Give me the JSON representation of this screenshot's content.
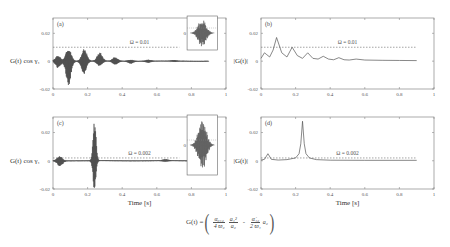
{
  "figure": {
    "formula": {
      "lhs": "G(t) =",
      "term1_num": "α₀₁₂",
      "term1_den": "4 ϖ₂",
      "term2_num": "a₁²",
      "term2_den": "a₂",
      "minus": "-",
      "term3_num": "α̇₁₂",
      "term3_den": "2 ϖ₁",
      "term3_tail": "a₂"
    }
  },
  "chart_data": [
    {
      "panel": "(a)",
      "type": "line",
      "title": "",
      "xlabel": "",
      "ylabel": "G(t) cos γ₁",
      "xlim": [
        0,
        1
      ],
      "ylim": [
        -0.02,
        0.031
      ],
      "xticks": [
        "0",
        "0.2",
        "0.4",
        "0.6",
        "0.8",
        "1"
      ],
      "yticks": [
        "-0.02",
        "0",
        "0.02"
      ],
      "annotation": "Ω = 0.01",
      "threshold": 0.01,
      "description": "Decaying oscillatory wave packets with peaks near t≈0.09, 0.18, 0.27, 0.36; inset shows zoomed packet",
      "envelope_peaks": [
        {
          "t": 0.03,
          "amp": 0.005
        },
        {
          "t": 0.09,
          "amp": 0.017
        },
        {
          "t": 0.18,
          "amp": 0.01
        },
        {
          "t": 0.27,
          "amp": 0.006
        },
        {
          "t": 0.36,
          "amp": 0.003
        },
        {
          "t": 0.45,
          "amp": 0.0015
        },
        {
          "t": 0.55,
          "amp": 0.001
        },
        {
          "t": 0.7,
          "amp": 0.0005
        }
      ],
      "inset": {
        "label": "0"
      }
    },
    {
      "panel": "(b)",
      "type": "line",
      "xlabel": "",
      "ylabel": "|G(t)|",
      "xlim": [
        0,
        1
      ],
      "ylim": [
        -0.02,
        0.031
      ],
      "xticks": [
        "0",
        "0.2",
        "0.4",
        "0.6",
        "0.8",
        "1"
      ],
      "yticks": [
        "-0.02",
        "0",
        "0.02"
      ],
      "annotation": "Ω = 0.01",
      "threshold": 0.01,
      "x": [
        0,
        0.02,
        0.03,
        0.05,
        0.07,
        0.09,
        0.12,
        0.15,
        0.18,
        0.21,
        0.24,
        0.27,
        0.3,
        0.33,
        0.36,
        0.39,
        0.42,
        0.45,
        0.48,
        0.51,
        0.55,
        0.6,
        0.7,
        0.8,
        0.9
      ],
      "values": [
        0.002,
        0.006,
        0.005,
        0.003,
        0.008,
        0.017,
        0.006,
        0.003,
        0.01,
        0.004,
        0.002,
        0.006,
        0.002,
        0.0015,
        0.0035,
        0.0015,
        0.001,
        0.0025,
        0.001,
        0.0008,
        0.0015,
        0.0008,
        0.0006,
        0.0005,
        0.0004
      ]
    },
    {
      "panel": "(c)",
      "type": "line",
      "xlabel": "Time [s]",
      "ylabel": "G(t) cos γ₁",
      "xlim": [
        0,
        1
      ],
      "ylim": [
        -0.02,
        0.031
      ],
      "xticks": [
        "0",
        "0.2",
        "0.4",
        "0.6",
        "0.8",
        "1"
      ],
      "yticks": [
        "-0.02",
        "0",
        "0.02"
      ],
      "annotation": "Ω = 0.002",
      "threshold": 0.002,
      "description": "Small packet near t≈0.04, large packet near t≈0.24 (amp ≈0.03), then near-zero with small ripples",
      "envelope_peaks": [
        {
          "t": 0.04,
          "amp": 0.004
        },
        {
          "t": 0.24,
          "amp": 0.03
        },
        {
          "t": 0.65,
          "amp": 0.0008
        }
      ],
      "inset": {
        "label": "0"
      }
    },
    {
      "panel": "(d)",
      "type": "line",
      "xlabel": "Time [s]",
      "ylabel": "|G(t)|",
      "xlim": [
        0,
        1
      ],
      "ylim": [
        -0.02,
        0.031
      ],
      "xticks": [
        "0",
        "0.2",
        "0.4",
        "0.6",
        "0.8",
        "1"
      ],
      "yticks": [
        "-0.02",
        "0",
        "0.02"
      ],
      "annotation": "Ω = 0.002",
      "threshold": 0.002,
      "x": [
        0,
        0.02,
        0.04,
        0.06,
        0.1,
        0.15,
        0.2,
        0.22,
        0.23,
        0.24,
        0.25,
        0.26,
        0.28,
        0.32,
        0.4,
        0.6,
        0.9
      ],
      "values": [
        0.0005,
        0.001,
        0.005,
        0.001,
        0.0005,
        0.0008,
        0.002,
        0.005,
        0.012,
        0.028,
        0.012,
        0.005,
        0.002,
        0.0008,
        0.0004,
        0.0003,
        0.0003
      ]
    }
  ]
}
